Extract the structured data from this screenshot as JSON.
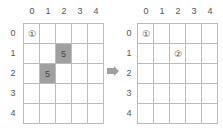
{
  "col_labels": [
    "0",
    "1",
    "2",
    "3",
    "4"
  ],
  "row_labels": [
    "0",
    "1",
    "2",
    "3",
    "4"
  ],
  "left_grid": {
    "cells": [
      [
        "①",
        "",
        "",
        "",
        ""
      ],
      [
        "",
        "",
        "5",
        "",
        ""
      ],
      [
        "",
        "5",
        "",
        "",
        ""
      ],
      [
        "",
        "",
        "",
        "",
        ""
      ],
      [
        "",
        "",
        "",
        "",
        ""
      ]
    ],
    "shaded": [
      [
        1,
        2
      ],
      [
        2,
        1
      ]
    ]
  },
  "right_grid": {
    "cells": [
      [
        "①",
        "",
        "",
        "",
        ""
      ],
      [
        "",
        "",
        "②",
        "",
        ""
      ],
      [
        "",
        "",
        "",
        "",
        ""
      ],
      [
        "",
        "",
        "",
        "",
        ""
      ],
      [
        "",
        "",
        "",
        "",
        ""
      ]
    ],
    "shaded": []
  },
  "arrow": {
    "icon": "right-arrow-icon",
    "color": "#a0a0a0"
  }
}
